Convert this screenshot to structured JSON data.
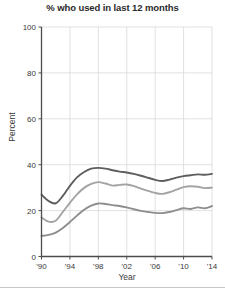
{
  "chart_data": {
    "type": "line",
    "title": "% who used in last 12 months",
    "xlabel": "Year",
    "ylabel": "Percent",
    "xlim": [
      1990,
      2014
    ],
    "ylim": [
      0,
      100
    ],
    "ytick_values": [
      0,
      20,
      40,
      60,
      80,
      100
    ],
    "ytick_labels": [
      "0",
      "20",
      "40",
      "60",
      "80",
      "100"
    ],
    "xtick_values": [
      1990,
      1994,
      1998,
      2002,
      2006,
      2010,
      2014
    ],
    "xtick_labels": [
      "'90",
      "'94",
      "'98",
      "'02",
      "'06",
      "'10",
      "'14"
    ],
    "grid": true,
    "legend": "none",
    "x": [
      1990,
      1991,
      1992,
      1993,
      1994,
      1995,
      1996,
      1997,
      1998,
      1999,
      2000,
      2001,
      2002,
      2003,
      2004,
      2005,
      2006,
      2007,
      2008,
      2009,
      2010,
      2011,
      2012,
      2013,
      2014
    ],
    "series": [
      {
        "name": "series-1",
        "color": "#5e5e5e",
        "values": [
          27.0,
          24.2,
          23.2,
          26.4,
          30.8,
          34.5,
          36.8,
          38.3,
          38.6,
          38.3,
          37.6,
          37.0,
          36.6,
          36.0,
          35.2,
          34.3,
          33.4,
          32.9,
          33.5,
          34.4,
          35.0,
          35.4,
          35.8,
          35.6,
          36.0
        ]
      },
      {
        "name": "series-2",
        "color": "#a3a3a3",
        "values": [
          17.0,
          15.2,
          15.6,
          19.4,
          23.4,
          27.1,
          29.9,
          31.6,
          32.4,
          31.8,
          30.9,
          31.2,
          31.4,
          30.7,
          29.6,
          28.6,
          27.7,
          27.3,
          28.0,
          29.1,
          30.2,
          30.6,
          30.4,
          29.8,
          30.0
        ]
      },
      {
        "name": "series-3",
        "color": "#8e8e8e",
        "values": [
          9.0,
          9.4,
          10.4,
          12.4,
          15.0,
          17.8,
          20.4,
          22.2,
          23.1,
          22.9,
          22.4,
          22.0,
          21.4,
          20.6,
          19.9,
          19.4,
          19.0,
          18.9,
          19.4,
          20.2,
          21.0,
          20.7,
          21.4,
          21.0,
          22.0
        ]
      }
    ]
  },
  "axis": {
    "y_label": "Percent",
    "x_label": "Year"
  }
}
